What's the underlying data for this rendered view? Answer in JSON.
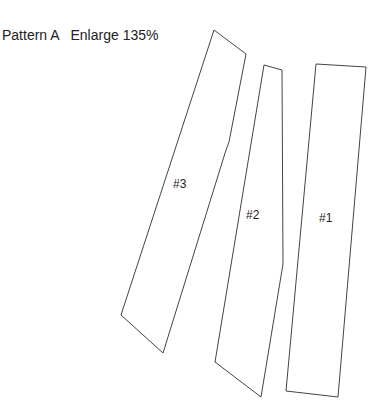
{
  "header": {
    "pattern": "Pattern A",
    "enlarge": "Enlarge 135%"
  },
  "pieces": [
    {
      "label": "#3",
      "points": "214,30 246,54 229,142 226,150 163,353 121,315"
    },
    {
      "label": "#2",
      "points": "264,65 282,70 283,264 261,397 215,362"
    },
    {
      "label": "#1",
      "points": "316,64 366,67 338,397 286,391"
    }
  ]
}
